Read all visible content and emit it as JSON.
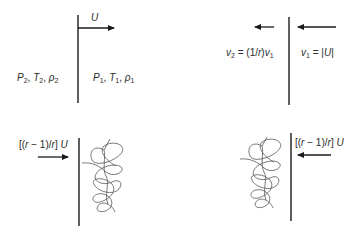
{
  "diagram": {
    "panels": [
      {
        "id": "top-left",
        "description": "Shock wave moving right at velocity U into stationary gas",
        "arrow_label": "U",
        "arrow_direction": "right",
        "left_state": {
          "P": "P",
          "P_sub": "2",
          "T": "T",
          "T_sub": "2",
          "rho": "ρ",
          "rho_sub": "2"
        },
        "right_state": {
          "P": "P",
          "P_sub": "1",
          "T": "T",
          "T_sub": "1",
          "rho": "ρ",
          "rho_sub": "1"
        }
      },
      {
        "id": "top-right",
        "description": "Shock frame: gas enters from right at v1 and leaves left at v2",
        "arrows": [
          "left-short",
          "left-long"
        ],
        "left_label": {
          "v": "v",
          "sub": "2",
          "eq": " = (1/",
          "r": "r",
          "close": ")",
          "v1": "v",
          "v1_sub": "1"
        },
        "right_label": {
          "v": "v",
          "sub": "1",
          "eq": " = |",
          "U": "U",
          "close": "|"
        }
      },
      {
        "id": "bottom-left",
        "description": "Piston moving right with turbulent region ahead",
        "arrow_direction": "right",
        "label": {
          "open": "[(",
          "r": "r",
          "mid": " − 1)/",
          "r2": "r",
          "close": "] ",
          "U": "U"
        }
      },
      {
        "id": "bottom-right",
        "description": "Wall frame: gas flows left with turbulent region behind",
        "arrow_direction": "left",
        "label": {
          "open": "[(",
          "r": "r",
          "mid": " − 1)/",
          "r2": "r",
          "close": "] ",
          "U": "U"
        }
      }
    ],
    "colors": {
      "line": "#1a1a1a",
      "squiggle": "#555555",
      "text": "#2a2a2a",
      "background": "#ffffff"
    }
  }
}
